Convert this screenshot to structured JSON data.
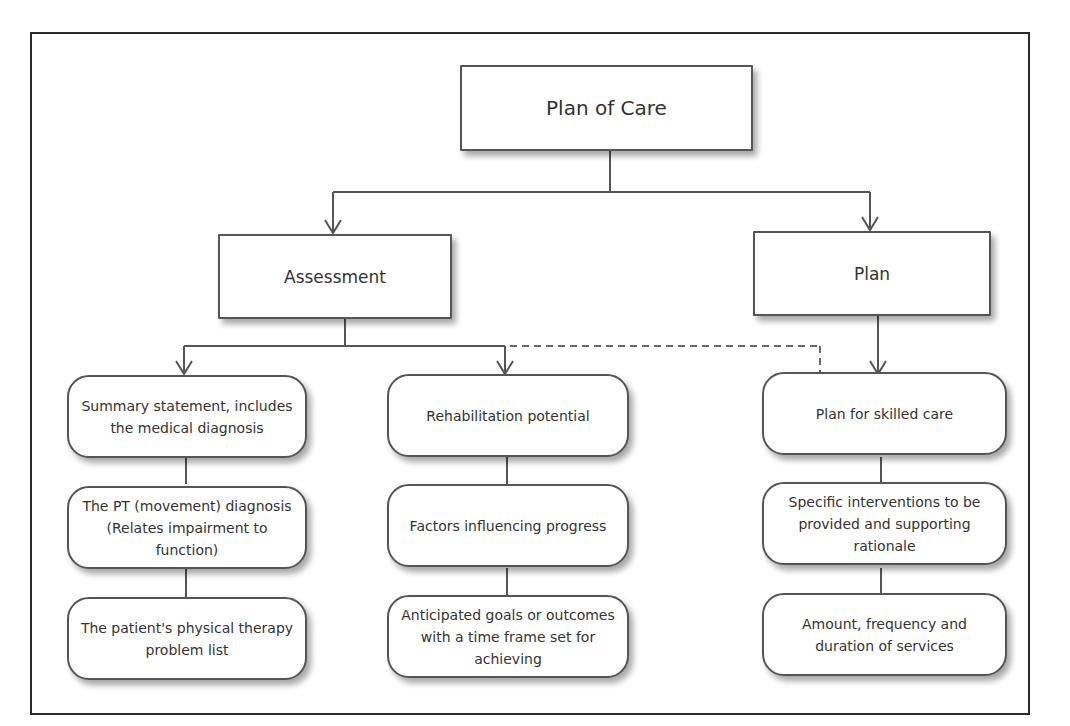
{
  "diagram": {
    "root": {
      "label": "Plan of Care"
    },
    "branches": [
      {
        "label": "Assessment",
        "children": [
          {
            "label": "Summary statement, includes the medical diagnosis",
            "chain": [
              "The PT (movement) diagnosis (Relates impairment to function)",
              "The patient's physical therapy problem list"
            ]
          },
          {
            "label": "Rehabilitation potential",
            "chain": [
              "Factors influencing progress",
              "Anticipated goals or outcomes with a time frame set for achieving"
            ]
          }
        ]
      },
      {
        "label": "Plan",
        "children": [
          {
            "label": "Plan for skilled care",
            "chain": [
              "Specific interventions to be provided and supporting rationale",
              "Amount, frequency and duration of services"
            ]
          }
        ]
      }
    ],
    "connectors": [
      {
        "from": "Plan of Care",
        "to": "Assessment",
        "style": "solid-arrow"
      },
      {
        "from": "Plan of Care",
        "to": "Plan",
        "style": "solid-arrow"
      },
      {
        "from": "Assessment",
        "to": "Summary statement, includes the medical diagnosis",
        "style": "solid-arrow"
      },
      {
        "from": "Assessment",
        "to": "Rehabilitation potential",
        "style": "solid-arrow"
      },
      {
        "from": "Rehabilitation potential",
        "to": "Plan for skilled care",
        "style": "dashed"
      },
      {
        "from": "Plan",
        "to": "Plan for skilled care",
        "style": "solid-arrow"
      }
    ],
    "colors": {
      "border": "#555555",
      "frame": "#2a2a2a",
      "text": "#333333",
      "background": "#ffffff"
    }
  }
}
